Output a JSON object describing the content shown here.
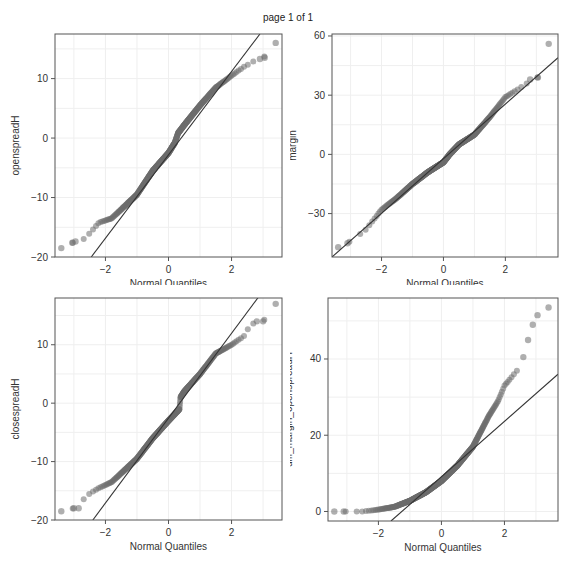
{
  "page": {
    "title": "page 1 of 1"
  },
  "style": {
    "point_color": "#6e6e6e",
    "point_opacity": 0.55,
    "line_color": "#333333",
    "frame_color": "#555555",
    "grid_color": "#efefef"
  },
  "chart_data": [
    {
      "type": "scatter",
      "subtype": "qq-plot",
      "title": "",
      "xlabel": "Normal Quantiles",
      "ylabel": "openspreadH",
      "xlim": [
        -3.6,
        3.6
      ],
      "ylim": [
        -20,
        17.5
      ],
      "xticks": [
        -2,
        0,
        2
      ],
      "yticks": [
        -20,
        -10,
        0,
        10
      ],
      "grid": true,
      "frame": {
        "left": 55,
        "top": 34,
        "right": 282,
        "bottom": 257
      },
      "quantile_curve": [
        [
          -3.4,
          -18.5
        ],
        [
          -3.0,
          -17.5
        ],
        [
          -2.7,
          -17
        ],
        [
          -2.5,
          -16
        ],
        [
          -2.2,
          -14.2
        ],
        [
          -1.8,
          -13.5
        ],
        [
          -1.5,
          -12
        ],
        [
          -1.0,
          -9.5
        ],
        [
          -0.5,
          -5.5
        ],
        [
          0.0,
          -2.5
        ],
        [
          0.2,
          -0.8
        ],
        [
          0.3,
          0.8
        ],
        [
          0.5,
          2.2
        ],
        [
          1.0,
          5.5
        ],
        [
          1.5,
          8.5
        ],
        [
          2.0,
          10.5
        ],
        [
          2.4,
          12
        ],
        [
          2.8,
          13.2
        ],
        [
          3.0,
          13.5
        ],
        [
          3.4,
          16
        ]
      ],
      "outliers": [
        [
          -3.4,
          -18.5
        ],
        [
          -3.05,
          -17.6
        ],
        [
          -2.95,
          -17.4
        ],
        [
          3.4,
          16
        ],
        [
          3.05,
          13.5
        ],
        [
          2.9,
          13.3
        ]
      ],
      "reference_line": [
        [
          -2.45,
          -20
        ],
        [
          2.9,
          17.5
        ]
      ]
    },
    {
      "type": "scatter",
      "subtype": "qq-plot",
      "title": "",
      "xlabel": "Normal Quantiles",
      "ylabel": "margin",
      "xlim": [
        -3.6,
        3.7
      ],
      "ylim": [
        -52,
        61
      ],
      "xticks": [
        -2,
        0,
        2
      ],
      "yticks": [
        -30,
        0,
        30,
        60
      ],
      "grid": true,
      "frame": {
        "left": 332,
        "top": 34,
        "right": 558,
        "bottom": 257
      },
      "quantile_curve": [
        [
          -3.4,
          -47
        ],
        [
          -3.0,
          -44
        ],
        [
          -2.5,
          -38
        ],
        [
          -2.0,
          -28
        ],
        [
          -1.5,
          -22
        ],
        [
          -1.0,
          -15
        ],
        [
          -0.5,
          -9
        ],
        [
          0.0,
          -4
        ],
        [
          0.2,
          0
        ],
        [
          0.5,
          5
        ],
        [
          1.0,
          10
        ],
        [
          1.5,
          19
        ],
        [
          2.0,
          29
        ],
        [
          2.5,
          34
        ],
        [
          2.9,
          38
        ],
        [
          3.05,
          39
        ]
      ],
      "outliers": [
        [
          -3.4,
          -47
        ],
        [
          -3.1,
          -45
        ],
        [
          3.4,
          56
        ],
        [
          3.05,
          39
        ],
        [
          2.8,
          38
        ]
      ],
      "reference_line": [
        [
          -3.6,
          -52
        ],
        [
          3.7,
          49
        ]
      ]
    },
    {
      "type": "scatter",
      "subtype": "qq-plot",
      "title": "",
      "xlabel": "Normal Quantiles",
      "ylabel": "closespreadH",
      "xlim": [
        -3.6,
        3.6
      ],
      "ylim": [
        -20,
        18
      ],
      "xticks": [
        -2,
        0,
        2
      ],
      "yticks": [
        -20,
        -10,
        0,
        10
      ],
      "grid": true,
      "frame": {
        "left": 55,
        "top": 298,
        "right": 282,
        "bottom": 520
      },
      "quantile_curve": [
        [
          -3.4,
          -18.5
        ],
        [
          -3.0,
          -18
        ],
        [
          -2.7,
          -16.5
        ],
        [
          -2.5,
          -15.5
        ],
        [
          -2.2,
          -14.5
        ],
        [
          -1.8,
          -13.5
        ],
        [
          -1.5,
          -12
        ],
        [
          -1.0,
          -9.5
        ],
        [
          -0.5,
          -6
        ],
        [
          0.0,
          -3
        ],
        [
          0.35,
          -1
        ],
        [
          0.38,
          1
        ],
        [
          0.5,
          2
        ],
        [
          1.0,
          5
        ],
        [
          1.5,
          8.5
        ],
        [
          2.0,
          10
        ],
        [
          2.4,
          11.5
        ],
        [
          2.6,
          13.5
        ],
        [
          3.0,
          14
        ],
        [
          3.4,
          17
        ]
      ],
      "outliers": [
        [
          -3.4,
          -18.5
        ],
        [
          -3.0,
          -18
        ],
        [
          -2.85,
          -18
        ],
        [
          3.4,
          17
        ],
        [
          3.0,
          14
        ],
        [
          2.8,
          14
        ]
      ],
      "reference_line": [
        [
          -2.4,
          -20
        ],
        [
          2.9,
          18.5
        ]
      ]
    },
    {
      "type": "scatter",
      "subtype": "qq-plot",
      "title": "",
      "xlabel": "Normal Quantiles",
      "ylabel": "diff_margin_openspreadH",
      "xlim": [
        -3.6,
        3.7
      ],
      "ylim": [
        -2.5,
        56
      ],
      "xticks": [
        -2,
        0,
        2
      ],
      "yticks": [
        0,
        20,
        40
      ],
      "grid": true,
      "frame": {
        "left": 328,
        "top": 298,
        "right": 558,
        "bottom": 521
      },
      "quantile_curve": [
        [
          -3.4,
          0
        ],
        [
          -3.0,
          0
        ],
        [
          -2.5,
          0
        ],
        [
          -2.0,
          0.5
        ],
        [
          -1.5,
          1.2
        ],
        [
          -1.0,
          2.8
        ],
        [
          -0.5,
          5
        ],
        [
          0.0,
          8
        ],
        [
          0.5,
          12
        ],
        [
          1.0,
          17
        ],
        [
          1.5,
          25
        ],
        [
          1.8,
          29
        ],
        [
          2.0,
          33
        ],
        [
          2.3,
          36
        ],
        [
          2.5,
          38
        ]
      ],
      "outliers": [
        [
          -3.4,
          0
        ],
        [
          -3.1,
          0
        ],
        [
          2.6,
          40.5
        ],
        [
          2.75,
          45
        ],
        [
          2.9,
          49
        ],
        [
          3.05,
          51.5
        ],
        [
          3.4,
          53.5
        ]
      ],
      "reference_line": [
        [
          -1.6,
          -2.5
        ],
        [
          3.7,
          36
        ]
      ]
    }
  ]
}
